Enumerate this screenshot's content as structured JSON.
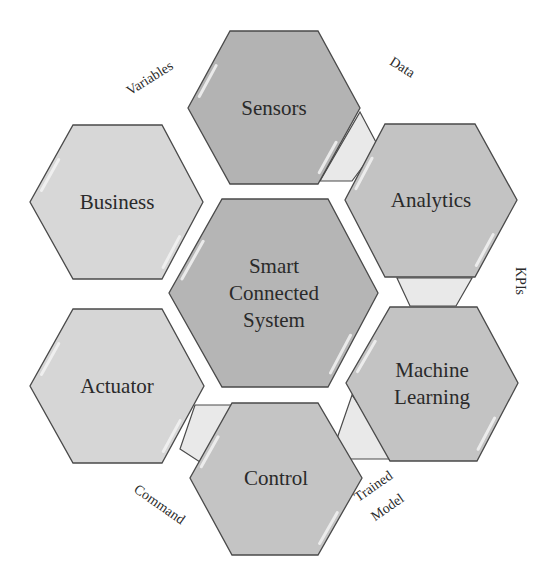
{
  "diagram": {
    "type": "hexagon-cycle",
    "center": {
      "id": "center",
      "lines": [
        "Smart",
        "Connected",
        "System"
      ],
      "fill": "#b5b5b5",
      "points": "222,199 328,199 378,293 328,387 222,387 169,293",
      "cx": 274,
      "cy": 293
    },
    "nodes": [
      {
        "id": "sensors",
        "lines": [
          "Sensors"
        ],
        "fill": "#b3b3b3",
        "points": "230,31 318,31 360,108 318,184 230,184 188,108",
        "cx": 274,
        "cy": 108
      },
      {
        "id": "analytics",
        "lines": [
          "Analytics"
        ],
        "fill": "#c3c3c3",
        "points": "385,124 475,124 517,200 475,277 385,277 345,200",
        "cx": 431,
        "cy": 200
      },
      {
        "id": "machine-learning",
        "lines": [
          "Machine",
          "Learning"
        ],
        "fill": "#c3c3c3",
        "points": "390,307 477,307 518,383 477,461 390,461 346,383",
        "cx": 432,
        "cy": 383
      },
      {
        "id": "control",
        "lines": [
          "Control"
        ],
        "fill": "#c4c4c4",
        "points": "232,403 318,403 362,478 318,555 232,555 190,478",
        "cx": 276,
        "cy": 478
      },
      {
        "id": "actuator",
        "lines": [
          "Actuator"
        ],
        "fill": "#d6d6d6",
        "points": "73,309 162,309 204,386 162,463 73,463 30,386",
        "cx": 117,
        "cy": 386
      },
      {
        "id": "business",
        "lines": [
          "Business"
        ],
        "fill": "#d7d7d7",
        "points": "73,125 162,125 203,202 162,279 73,279 30,202",
        "cx": 117,
        "cy": 202
      }
    ],
    "connectors": [
      {
        "id": "sensors-analytics",
        "fill": "#e9e9e9",
        "points": "360,112 378,146 352,181 320,181"
      },
      {
        "id": "analytics-ml",
        "fill": "#e9e9e9",
        "points": "397,278 472,278 456,306 410,306"
      },
      {
        "id": "ml-control",
        "fill": "#e9e9e9",
        "points": "352,395 376,430 399,459 330,459"
      },
      {
        "id": "control-actuator",
        "fill": "#e9e9e9",
        "points": "195,405 233,405 203,464 180,449"
      }
    ],
    "flow_labels": [
      {
        "id": "variables",
        "text": "Variables",
        "x": 152,
        "y": 82,
        "rotate": -32
      },
      {
        "id": "data",
        "text": "Data",
        "x": 400,
        "y": 71,
        "rotate": 32
      },
      {
        "id": "kpis",
        "text": "KPIs",
        "x": 516,
        "y": 281,
        "rotate": 90
      },
      {
        "id": "trained",
        "text": "Trained",
        "x": 376,
        "y": 490,
        "rotate": -35
      },
      {
        "id": "model",
        "text": "Model",
        "x": 390,
        "y": 511,
        "rotate": -35
      },
      {
        "id": "command",
        "text": "Command",
        "x": 157,
        "y": 508,
        "rotate": 35
      }
    ],
    "stroke": "#4a4a4a",
    "highlight": "#f4f4f4"
  }
}
